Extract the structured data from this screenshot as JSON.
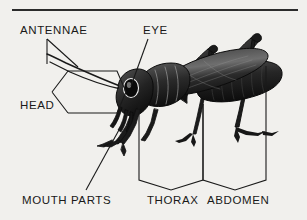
{
  "figure": {
    "background_color": "#f1f0ed",
    "ink_color": "#191919"
  },
  "rule": {
    "name": "top-divider-rule"
  },
  "labels": {
    "antennae": "ANTENNAE",
    "eye": "EYE",
    "head": "HEAD",
    "mouth_parts": "MOUTH PARTS",
    "thorax": "THORAX",
    "abdomen": "ABDOMEN"
  },
  "callouts": [
    {
      "label": "ANTENNAE",
      "style": "double-leader-line",
      "points_to": "antennae"
    },
    {
      "label": "EYE",
      "style": "single-leader-line",
      "points_to": "compound-eye"
    },
    {
      "label": "HEAD",
      "style": "angular-bracket",
      "points_to": "head-segment"
    },
    {
      "label": "MOUTH PARTS",
      "style": "single-leader-line",
      "points_to": "mouthparts"
    },
    {
      "label": "THORAX",
      "style": "angular-bracket",
      "points_to": "thorax-segment"
    },
    {
      "label": "ABDOMEN",
      "style": "angular-bracket",
      "points_to": "abdomen-segment"
    }
  ]
}
